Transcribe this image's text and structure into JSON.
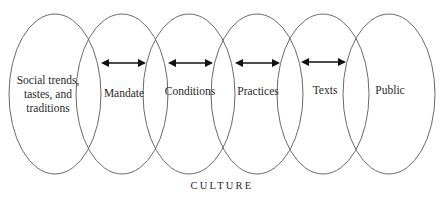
{
  "diagram": {
    "type": "overlapping-ellipses-chain",
    "stroke_color": "#6a6a6a",
    "arrow_color": "#111111",
    "nodes": [
      {
        "id": "social",
        "lines": [
          "Social trends,",
          "tastes, and",
          "traditions"
        ],
        "cx": 55,
        "cy": 94,
        "rx": 46,
        "ry": 80
      },
      {
        "id": "mandate",
        "lines": [
          "Mandate"
        ],
        "cx": 122,
        "cy": 94,
        "rx": 46,
        "ry": 80
      },
      {
        "id": "conditions",
        "lines": [
          "Conditions"
        ],
        "cx": 189,
        "cy": 94,
        "rx": 46,
        "ry": 80
      },
      {
        "id": "practices",
        "lines": [
          "Practices"
        ],
        "cx": 257,
        "cy": 94,
        "rx": 46,
        "ry": 80
      },
      {
        "id": "texts",
        "lines": [
          "Texts"
        ],
        "cx": 323,
        "cy": 94,
        "rx": 46,
        "ry": 80
      },
      {
        "id": "public",
        "lines": [
          "Public"
        ],
        "cx": 389,
        "cy": 94,
        "rx": 46,
        "ry": 80
      }
    ],
    "arrows": [
      {
        "between": [
          "mandate",
          "conditions"
        ],
        "x1": 101,
        "x2": 146,
        "y": 63,
        "direction": "both"
      },
      {
        "between": [
          "conditions",
          "practices"
        ],
        "x1": 168,
        "x2": 213,
        "y": 63,
        "direction": "both"
      },
      {
        "between": [
          "practices",
          "texts"
        ],
        "x1": 235,
        "x2": 280,
        "y": 63,
        "direction": "both"
      },
      {
        "between": [
          "texts",
          "public"
        ],
        "x1": 301,
        "x2": 346,
        "y": 62,
        "direction": "both"
      }
    ],
    "caption": "CULTURE"
  },
  "labels": {
    "social_1": "Social trends,",
    "social_2": "tastes, and",
    "social_3": "traditions",
    "mandate": "Mandate",
    "conditions": "Conditions",
    "practices": "Practices",
    "texts": "Texts",
    "public": "Public",
    "caption": "CULTURE"
  }
}
